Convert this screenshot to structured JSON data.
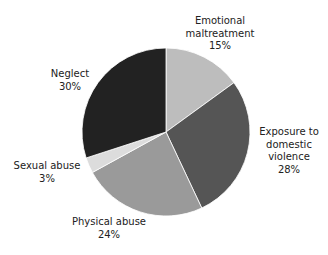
{
  "chart_data": {
    "type": "pie",
    "title": "",
    "categories": [
      "Emotional maltreatment",
      "Exposure to domestic violence",
      "Physical abuse",
      "Sexual abuse",
      "Neglect"
    ],
    "values": [
      15,
      28,
      24,
      3,
      30
    ],
    "unit": "%",
    "colors": [
      "#bdbdbd",
      "#555555",
      "#9a9a9a",
      "#dcdcdc",
      "#222222"
    ],
    "legend": "none"
  },
  "labels": {
    "emotional": {
      "name": "Emotional\nmaltreatment",
      "pct": "15%"
    },
    "exposure": {
      "name": "Exposure to\ndomestic\nviolence",
      "pct": "28%"
    },
    "physical": {
      "name": "Physical abuse",
      "pct": "24%"
    },
    "sexual": {
      "name": "Sexual abuse",
      "pct": "3%"
    },
    "neglect": {
      "name": "Neglect",
      "pct": "30%"
    }
  }
}
